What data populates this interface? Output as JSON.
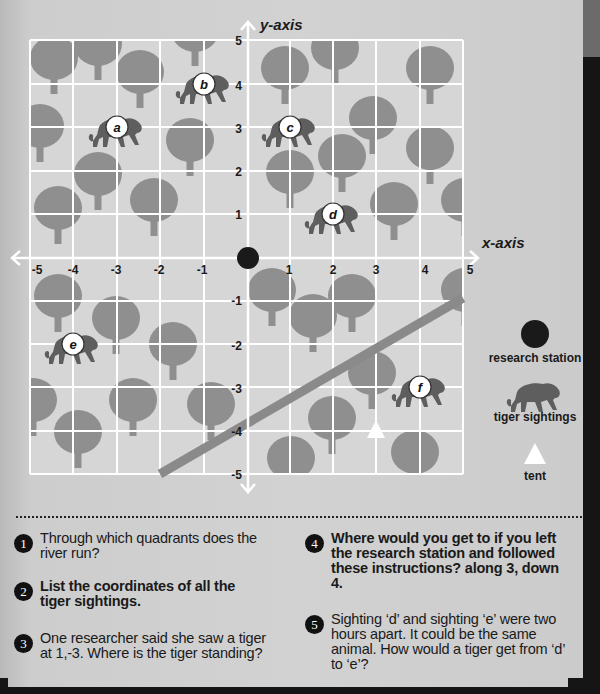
{
  "axes": {
    "x_label": "x-axis",
    "y_label": "y-axis",
    "x_ticks": [
      "-5",
      "-4",
      "-3",
      "-2",
      "-1",
      "1",
      "2",
      "3",
      "4",
      "5"
    ],
    "y_ticks": [
      "5",
      "4",
      "3",
      "2",
      "1",
      "-1",
      "-2",
      "-3",
      "-4",
      "-5"
    ],
    "range": {
      "x": [
        -5,
        5
      ],
      "y": [
        -5,
        5
      ]
    }
  },
  "colors": {
    "grid_bg": "#d6d6d6",
    "grid_line": "#ffffff",
    "tree": "#8f8f8f",
    "river": "#8a8a8a",
    "tiger": "#5e5e5e",
    "station": "#1a1a1a",
    "tent": "#ffffff"
  },
  "features": {
    "research_station": {
      "x": 0,
      "y": 0
    },
    "tent": {
      "x": 3,
      "y": -4
    },
    "tiger_sightings": [
      {
        "label": "a",
        "x": -3,
        "y": 3
      },
      {
        "label": "b",
        "x": -1,
        "y": 4
      },
      {
        "label": "c",
        "x": 1,
        "y": 3
      },
      {
        "label": "d",
        "x": 2,
        "y": 1
      },
      {
        "label": "e",
        "x": -4,
        "y": -2
      },
      {
        "label": "f",
        "x": 4,
        "y": -3
      }
    ],
    "river": {
      "from": {
        "x": -2,
        "y": -5
      },
      "to": {
        "x": 5,
        "y": -1
      }
    }
  },
  "legend": [
    {
      "icon": "research-station-dot",
      "label": "research station"
    },
    {
      "icon": "tiger-icon",
      "label": "tiger sightings"
    },
    {
      "icon": "tent-triangle",
      "label": "tent"
    }
  ],
  "questions": [
    {
      "number": "1",
      "text": "Through which quadrants does the river run?",
      "bold": false
    },
    {
      "number": "2",
      "text": "List the coordinates of all the tiger sightings.",
      "bold": true
    },
    {
      "number": "3",
      "text": "One researcher said she saw a tiger at 1,-3. Where is the tiger standing?",
      "bold": false
    },
    {
      "number": "4",
      "text": "Where would you get to if you left the research station and followed these instructions? along 3, down 4.",
      "bold": true
    },
    {
      "number": "5",
      "text": "Sighting ‘d’ and sighting ‘e’ were two hours apart. It could be the same animal. How would a tiger get from ‘d’ to ‘e’?",
      "bold": false
    }
  ]
}
